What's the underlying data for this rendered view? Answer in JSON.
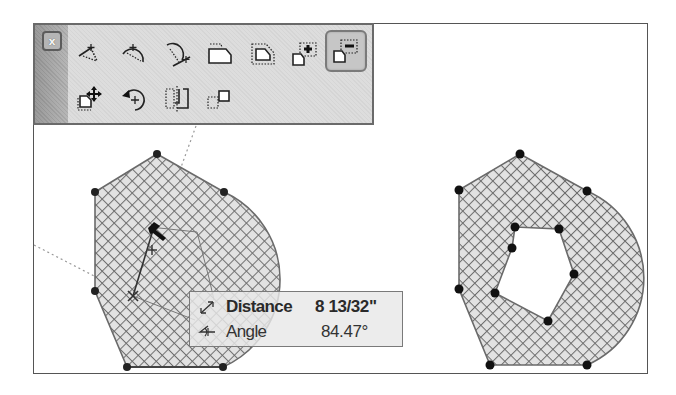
{
  "toolbar": {
    "close_label": "x",
    "row1": [
      {
        "name": "angle-tool-icon",
        "active": false
      },
      {
        "name": "arc-angle-tool-icon",
        "active": false
      },
      {
        "name": "arc-tangent-tool-icon",
        "active": false
      },
      {
        "name": "shape-solid-icon",
        "active": false
      },
      {
        "name": "shape-offset-icon",
        "active": false
      },
      {
        "name": "shape-add-icon",
        "active": false
      },
      {
        "name": "shape-subtract-icon",
        "active": true
      }
    ],
    "row2": [
      {
        "name": "shape-move-icon",
        "active": false
      },
      {
        "name": "shape-rotate-icon",
        "active": false
      },
      {
        "name": "shape-mirror-icon",
        "active": false
      },
      {
        "name": "shape-copy-icon",
        "active": false
      }
    ]
  },
  "tooltip": {
    "distance_label": "Distance",
    "distance_value": "8 13/32\"",
    "angle_label": "Angle",
    "angle_value": "84.47°",
    "distance_icon": "distance-arrows-icon",
    "angle_icon": "angle-icon"
  },
  "colors": {
    "hatch_fill": "#e2e2e2",
    "hatch_line": "#6e6e6e",
    "vertex": "#111111",
    "frame": "#555555",
    "toolbar_bg": "#dddddd"
  }
}
